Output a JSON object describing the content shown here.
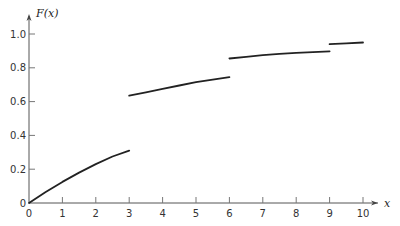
{
  "chart_data": {
    "type": "line",
    "title": "",
    "xlabel": "x",
    "ylabel": "F(x)",
    "xlim": [
      0,
      10
    ],
    "ylim": [
      0,
      1.0
    ],
    "grid": false,
    "legend": null,
    "x_ticks": [
      "0",
      "1",
      "2",
      "3",
      "4",
      "5",
      "6",
      "7",
      "8",
      "9",
      "10"
    ],
    "y_ticks": [
      "0",
      "0.2",
      "0.4",
      "0.6",
      "0.8",
      "1.0"
    ],
    "series": [
      {
        "name": "F(x) segment 1",
        "x": [
          0,
          0.5,
          1,
          1.5,
          2,
          2.5,
          3
        ],
        "values": [
          0,
          0.065,
          0.125,
          0.18,
          0.23,
          0.275,
          0.31
        ]
      },
      {
        "name": "F(x) segment 2",
        "x": [
          3,
          3.5,
          4,
          4.5,
          5,
          5.5,
          6
        ],
        "values": [
          0.635,
          0.655,
          0.675,
          0.695,
          0.715,
          0.73,
          0.745
        ]
      },
      {
        "name": "F(x) segment 3",
        "x": [
          6,
          6.5,
          7,
          7.5,
          8,
          8.5,
          9
        ],
        "values": [
          0.855,
          0.865,
          0.875,
          0.882,
          0.888,
          0.893,
          0.897
        ]
      },
      {
        "name": "F(x) segment 4",
        "x": [
          9,
          9.5,
          10
        ],
        "values": [
          0.94,
          0.945,
          0.95
        ]
      }
    ]
  }
}
